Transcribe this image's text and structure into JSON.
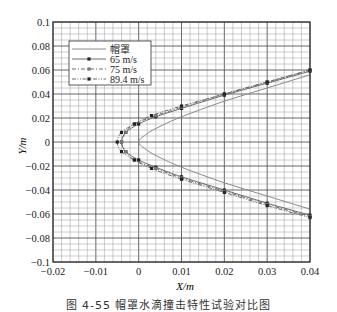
{
  "chart_data": {
    "type": "line",
    "title": "",
    "xlabel": "X/m",
    "ylabel": "Y/m",
    "xlim": [
      -0.02,
      0.04
    ],
    "ylim": [
      -0.1,
      0.1
    ],
    "xticks": [
      "-0.02",
      "-0.01",
      "0",
      "0.01",
      "0.02",
      "0.03",
      "0.04"
    ],
    "yticks": [
      "-0.1",
      "-0.08",
      "-0.06",
      "-0.04",
      "-0.02",
      "0",
      "0.02",
      "0.04",
      "0.06",
      "0.08",
      "0.1"
    ],
    "grid": true,
    "legend_position": "upper left",
    "legend": [
      "帽罩",
      "65 m/s",
      "75 m/s",
      "89.4 m/s"
    ],
    "series": [
      {
        "name": "帽罩",
        "style": "solid",
        "marker": "none",
        "x": [
          0.04,
          0.03,
          0.02,
          0.01,
          0.005,
          0.002,
          0.0,
          0.002,
          0.005,
          0.01,
          0.02,
          0.03,
          0.04
        ],
        "y": [
          0.056,
          0.045,
          0.034,
          0.021,
          0.013,
          0.007,
          0.0,
          -0.007,
          -0.013,
          -0.021,
          -0.034,
          -0.045,
          -0.056
        ]
      },
      {
        "name": "65 m/s",
        "style": "solid",
        "marker": "square",
        "x": [
          0.04,
          0.03,
          0.02,
          0.01,
          0.004,
          0.0,
          -0.003,
          -0.004,
          -0.003,
          0.0,
          0.004,
          0.01,
          0.02,
          0.03,
          0.04
        ],
        "y": [
          0.059,
          0.049,
          0.039,
          0.028,
          0.021,
          0.015,
          0.008,
          0.0,
          -0.008,
          -0.015,
          -0.021,
          -0.029,
          -0.04,
          -0.051,
          -0.061
        ]
      },
      {
        "name": "75 m/s",
        "style": "dashdot",
        "marker": "square",
        "x": [
          0.04,
          0.03,
          0.02,
          0.01,
          0.004,
          -0.001,
          -0.003,
          -0.004,
          -0.003,
          -0.001,
          0.004,
          0.01,
          0.02,
          0.03,
          0.04
        ],
        "y": [
          0.06,
          0.05,
          0.04,
          0.029,
          0.022,
          0.015,
          0.008,
          0.0,
          -0.008,
          -0.015,
          -0.022,
          -0.03,
          -0.041,
          -0.052,
          -0.062
        ]
      },
      {
        "name": "89.4 m/s",
        "style": "dashdotdot",
        "marker": "square",
        "x": [
          0.04,
          0.03,
          0.02,
          0.01,
          0.003,
          -0.001,
          -0.004,
          -0.005,
          -0.004,
          -0.001,
          0.003,
          0.01,
          0.02,
          0.03,
          0.04
        ],
        "y": [
          0.06,
          0.05,
          0.04,
          0.03,
          0.022,
          0.015,
          0.008,
          0.0,
          -0.008,
          -0.015,
          -0.022,
          -0.031,
          -0.042,
          -0.053,
          -0.063
        ]
      }
    ]
  },
  "caption": "图 4-55  帽罩水滴撞击特性试验对比图",
  "colors": {
    "axis": "#333333",
    "grid_major": "#555555",
    "grid_minor": "#9a9a9a",
    "curve": "#888888",
    "marker": "#222222"
  }
}
